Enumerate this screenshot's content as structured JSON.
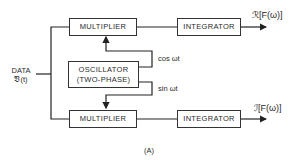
{
  "diagram": {
    "caption": "(A)",
    "input": {
      "line1": "DATA",
      "line2": "𝔙(t)"
    },
    "blocks": {
      "multiplier_top": "MULTIPLIER",
      "integrator_top": "INTEGRATOR",
      "oscillator_line1": "OSCILLATOR",
      "oscillator_line2": "(TWO-PHASE)",
      "multiplier_bottom": "MULTIPLIER",
      "integrator_bottom": "INTEGRATOR"
    },
    "signals": {
      "cos": "cos ωt",
      "sin": "sin ωt"
    },
    "outputs": {
      "real": "ℛ[F(ω)]",
      "imag": "ℐ[F(ω)]"
    }
  }
}
